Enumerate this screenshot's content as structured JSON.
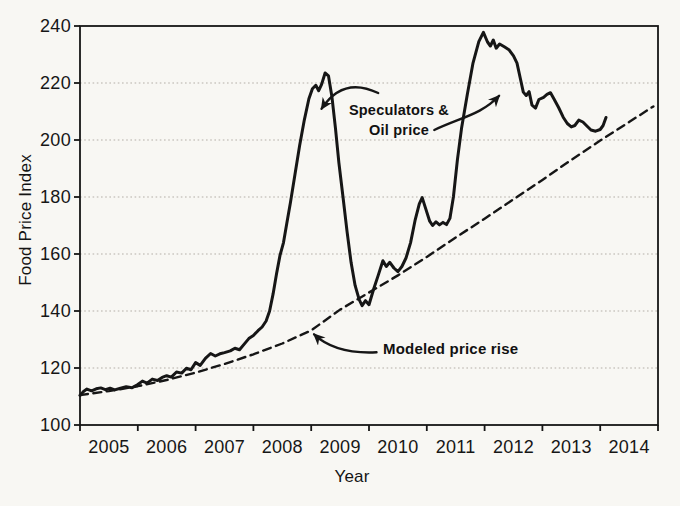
{
  "figure": {
    "background_color": "#f8f7f3",
    "ink_color": "#161616",
    "grid_color": "#b3afa8"
  },
  "chart_data": {
    "type": "line",
    "title": "",
    "xlabel": "Year",
    "ylabel": "Food Price Index",
    "xlim": [
      2004.5,
      2014.5
    ],
    "ylim": [
      100,
      240
    ],
    "grid": "horizontal-dotted",
    "legend_position": "none (labeled by in-plot annotations)",
    "xticks": [
      2004.5,
      2005.5,
      2006.5,
      2007.5,
      2008.5,
      2009.5,
      2010.5,
      2011.5,
      2012.5,
      2013.5,
      2014.5
    ],
    "xtick_labels": [
      "2005",
      "2006",
      "2007",
      "2008",
      "2009",
      "2010",
      "2011",
      "2012",
      "2013",
      "2014"
    ],
    "xtick_label_positions": [
      2005,
      2006,
      2007,
      2008,
      2009,
      2010,
      2011,
      2012,
      2013,
      2014
    ],
    "yticks": [
      100,
      120,
      140,
      160,
      180,
      200,
      220,
      240
    ],
    "ytick_labels": [
      "100",
      "120",
      "140",
      "160",
      "180",
      "200",
      "220",
      "240"
    ],
    "series": [
      {
        "id": "food-price-index-actual",
        "style": "solid",
        "stroke_width": 3,
        "points": [
          [
            2004.5,
            110.4
          ],
          [
            2004.56,
            111.8
          ],
          [
            2004.62,
            112.6
          ],
          [
            2004.7,
            112.0
          ],
          [
            2004.78,
            112.7
          ],
          [
            2004.86,
            113.0
          ],
          [
            2004.94,
            112.4
          ],
          [
            2005.02,
            112.9
          ],
          [
            2005.1,
            112.3
          ],
          [
            2005.2,
            112.9
          ],
          [
            2005.3,
            113.4
          ],
          [
            2005.4,
            113.1
          ],
          [
            2005.5,
            114.2
          ],
          [
            2005.58,
            115.4
          ],
          [
            2005.66,
            114.7
          ],
          [
            2005.75,
            116.1
          ],
          [
            2005.84,
            115.6
          ],
          [
            2005.92,
            116.7
          ],
          [
            2006.0,
            117.3
          ],
          [
            2006.08,
            116.8
          ],
          [
            2006.17,
            118.6
          ],
          [
            2006.26,
            118.2
          ],
          [
            2006.34,
            119.9
          ],
          [
            2006.42,
            119.4
          ],
          [
            2006.5,
            121.9
          ],
          [
            2006.58,
            120.9
          ],
          [
            2006.67,
            123.4
          ],
          [
            2006.76,
            125.1
          ],
          [
            2006.84,
            124.2
          ],
          [
            2006.92,
            125.0
          ],
          [
            2007.0,
            125.4
          ],
          [
            2007.1,
            126.0
          ],
          [
            2007.18,
            126.9
          ],
          [
            2007.26,
            126.4
          ],
          [
            2007.34,
            128.4
          ],
          [
            2007.42,
            130.3
          ],
          [
            2007.5,
            131.4
          ],
          [
            2007.58,
            133.1
          ],
          [
            2007.65,
            134.4
          ],
          [
            2007.72,
            136.5
          ],
          [
            2007.78,
            140.0
          ],
          [
            2007.84,
            146.0
          ],
          [
            2007.9,
            153.0
          ],
          [
            2007.96,
            159.5
          ],
          [
            2008.02,
            164.0
          ],
          [
            2008.08,
            171.0
          ],
          [
            2008.14,
            178.0
          ],
          [
            2008.22,
            188.0
          ],
          [
            2008.3,
            198.0
          ],
          [
            2008.38,
            207.0
          ],
          [
            2008.46,
            214.5
          ],
          [
            2008.52,
            218.0
          ],
          [
            2008.58,
            219.2
          ],
          [
            2008.63,
            217.3
          ],
          [
            2008.68,
            219.5
          ],
          [
            2008.74,
            223.5
          ],
          [
            2008.8,
            222.5
          ],
          [
            2008.86,
            215.0
          ],
          [
            2008.92,
            204.0
          ],
          [
            2008.98,
            192.0
          ],
          [
            2009.05,
            180.0
          ],
          [
            2009.12,
            168.0
          ],
          [
            2009.19,
            157.0
          ],
          [
            2009.26,
            149.0
          ],
          [
            2009.33,
            144.0
          ],
          [
            2009.38,
            141.9
          ],
          [
            2009.44,
            143.6
          ],
          [
            2009.5,
            142.2
          ],
          [
            2009.58,
            147.6
          ],
          [
            2009.66,
            152.5
          ],
          [
            2009.74,
            157.6
          ],
          [
            2009.8,
            155.6
          ],
          [
            2009.86,
            157.1
          ],
          [
            2009.93,
            155.1
          ],
          [
            2010.0,
            153.8
          ],
          [
            2010.07,
            155.6
          ],
          [
            2010.14,
            158.6
          ],
          [
            2010.22,
            164.0
          ],
          [
            2010.3,
            172.0
          ],
          [
            2010.37,
            177.6
          ],
          [
            2010.42,
            179.8
          ],
          [
            2010.48,
            176.0
          ],
          [
            2010.55,
            171.5
          ],
          [
            2010.6,
            170.0
          ],
          [
            2010.66,
            171.3
          ],
          [
            2010.72,
            170.2
          ],
          [
            2010.78,
            171.1
          ],
          [
            2010.84,
            170.3
          ],
          [
            2010.9,
            172.5
          ],
          [
            2010.96,
            180.0
          ],
          [
            2011.03,
            193.0
          ],
          [
            2011.1,
            204.0
          ],
          [
            2011.2,
            216.0
          ],
          [
            2011.3,
            227.0
          ],
          [
            2011.4,
            234.5
          ],
          [
            2011.48,
            237.8
          ],
          [
            2011.55,
            234.4
          ],
          [
            2011.6,
            233.0
          ],
          [
            2011.65,
            235.1
          ],
          [
            2011.7,
            232.2
          ],
          [
            2011.76,
            233.7
          ],
          [
            2011.84,
            232.7
          ],
          [
            2011.92,
            231.7
          ],
          [
            2012.0,
            229.5
          ],
          [
            2012.06,
            227.0
          ],
          [
            2012.12,
            221.5
          ],
          [
            2012.17,
            216.8
          ],
          [
            2012.22,
            215.6
          ],
          [
            2012.27,
            217.0
          ],
          [
            2012.32,
            212.2
          ],
          [
            2012.38,
            211.2
          ],
          [
            2012.44,
            214.2
          ],
          [
            2012.52,
            215.0
          ],
          [
            2012.58,
            216.0
          ],
          [
            2012.64,
            216.6
          ],
          [
            2012.7,
            214.4
          ],
          [
            2012.78,
            211.4
          ],
          [
            2012.86,
            208.0
          ],
          [
            2012.93,
            205.8
          ],
          [
            2013.0,
            204.6
          ],
          [
            2013.06,
            205.1
          ],
          [
            2013.13,
            207.0
          ],
          [
            2013.2,
            206.3
          ],
          [
            2013.27,
            204.9
          ],
          [
            2013.34,
            203.5
          ],
          [
            2013.42,
            203.1
          ],
          [
            2013.5,
            203.7
          ],
          [
            2013.55,
            205.1
          ],
          [
            2013.6,
            207.9
          ]
        ]
      },
      {
        "id": "modeled-price-rise",
        "style": "dashed",
        "stroke_width": 2.4,
        "dash_pattern": "8 5.5",
        "points": [
          [
            2004.5,
            110.5
          ],
          [
            2005.0,
            111.9
          ],
          [
            2005.5,
            113.6
          ],
          [
            2006.0,
            115.8
          ],
          [
            2006.5,
            118.4
          ],
          [
            2007.0,
            121.4
          ],
          [
            2007.5,
            124.8
          ],
          [
            2008.0,
            128.6
          ],
          [
            2008.5,
            133.2
          ],
          [
            2009.0,
            140.5
          ],
          [
            2009.5,
            146.5
          ],
          [
            2010.0,
            152.5
          ],
          [
            2010.5,
            159.0
          ],
          [
            2011.0,
            165.8
          ],
          [
            2011.5,
            172.4
          ],
          [
            2012.0,
            179.2
          ],
          [
            2012.5,
            186.0
          ],
          [
            2013.0,
            193.0
          ],
          [
            2013.5,
            199.8
          ],
          [
            2014.0,
            206.3
          ],
          [
            2014.42,
            211.8
          ]
        ]
      }
    ],
    "annotations": [
      {
        "id": "speculators-oil",
        "line1": "Speculators &",
        "line2": "Oil price",
        "arrows": [
          {
            "id": "speculators-left-arrow",
            "from": [
              2009.66,
              216.5
            ],
            "c1": [
              2009.25,
              220.5
            ],
            "c2": [
              2008.92,
              218.5
            ],
            "to": [
              2008.68,
              211.0
            ]
          },
          {
            "id": "speculators-right-arrow",
            "from": [
              2010.63,
              203.5
            ],
            "c1": [
              2011.1,
              208.0
            ],
            "c2": [
              2011.45,
              209.0
            ],
            "to": [
              2011.75,
              215.5
            ]
          }
        ]
      },
      {
        "id": "modeled-price-rise-label",
        "text": "Modeled price rise",
        "arrows": [
          {
            "id": "modeled-arrow",
            "from": [
              2009.63,
              125.5
            ],
            "c1": [
              2009.1,
              125.0
            ],
            "c2": [
              2008.75,
              128.0
            ],
            "to": [
              2008.55,
              131.8
            ]
          }
        ]
      }
    ]
  }
}
